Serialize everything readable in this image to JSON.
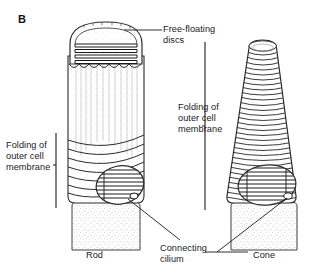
{
  "figure": {
    "panel_letter": "B",
    "background_color": "#ffffff",
    "ink_color": "#1a1a1a"
  },
  "labels": {
    "free_floating_discs": "Free-floating\ndiscs",
    "folding_right": "Folding of\nouter cell\nmembrane",
    "folding_left": "Folding of\nouter cell\nmembrane",
    "connecting_cilium": "Connecting\ncilium",
    "rod": "Rod",
    "cone": "Cone"
  },
  "structures": {
    "rod": {
      "name": "Rod",
      "outer_segment_shape": "cylinder-with-domed-cap",
      "disc_type": "free-floating discs",
      "visible_disc_count": 4,
      "membrane_fold_count": 9,
      "has_cutaway_window": true,
      "has_connecting_cilium": true
    },
    "cone": {
      "name": "Cone",
      "outer_segment_shape": "tapered-cone",
      "disc_type": "infoldings of outer cell membrane",
      "membrane_fold_count": 34,
      "has_cutaway_window": true,
      "has_connecting_cilium": true
    }
  },
  "annotations": {
    "bracket_left": "folding-of-outer-cell-membrane-rod",
    "bracket_right": "folding-of-outer-cell-membrane-cone",
    "leader_free_discs": "points to rod outer segment dome",
    "leader_cilium_rod": "points to rod connecting cilium",
    "leader_cilium_cone": "points to cone connecting cilium"
  }
}
